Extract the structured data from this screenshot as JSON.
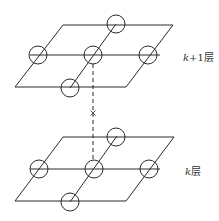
{
  "diagram": {
    "type": "layered-grid",
    "layers": [
      {
        "id": "upper",
        "label_var": "k",
        "label_suffix": "+1层",
        "nodes": [
          "top",
          "left",
          "center",
          "right",
          "bottom"
        ]
      },
      {
        "id": "lower",
        "label_var": "k",
        "label_suffix": "层",
        "nodes": [
          "top",
          "left",
          "center",
          "right",
          "bottom"
        ]
      }
    ],
    "connector": {
      "style": "dashed",
      "from": "upper.center",
      "to": "lower.center",
      "marker": "×"
    }
  }
}
